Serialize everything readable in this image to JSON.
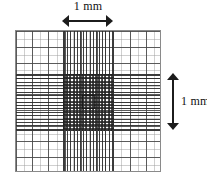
{
  "figure": {
    "kind": "counting-chamber-grid"
  },
  "labels": {
    "top_scale": "1 mm",
    "right_scale": "1 mm"
  },
  "grid": {
    "outer_border_color": "#8a8a8a",
    "coarse_line_color": "#464646",
    "fine_line_color": "#282828",
    "background_color": "#ffffff",
    "coarse_columns": 9,
    "coarse_rows": 9,
    "dense_band_vertical_columns": 16,
    "dense_band_horizontal_rows": 17,
    "center_cell_present": "yes"
  },
  "annotations": {
    "top_arrow": "double-headed-horizontal-arrow",
    "right_arrow": "double-headed-vertical-arrow"
  }
}
